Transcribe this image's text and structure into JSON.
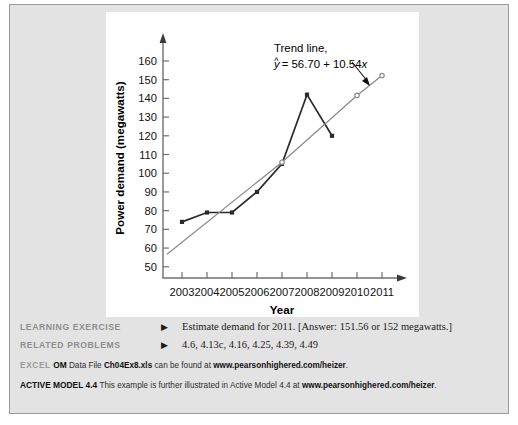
{
  "chart_data": {
    "type": "line",
    "title": "",
    "xlabel": "Year",
    "ylabel": "Power demand (megawatts)",
    "x": [
      2003,
      2004,
      2005,
      2006,
      2007,
      2008,
      2009,
      2010,
      2011
    ],
    "xlim": [
      2002.4,
      2011.6
    ],
    "ylim": [
      44,
      168
    ],
    "yticks": [
      50,
      60,
      70,
      80,
      90,
      100,
      110,
      120,
      130,
      140,
      150,
      160
    ],
    "xticks": [
      "2003",
      "2004",
      "2005",
      "2006",
      "2007",
      "2008",
      "2009",
      "2010",
      "2011"
    ],
    "grid": false,
    "legend": "none",
    "series": [
      {
        "name": "Actual power demand",
        "color": "#2b2b2b",
        "marker": "square",
        "x": [
          2003,
          2004,
          2005,
          2006,
          2007,
          2008,
          2009
        ],
        "values": [
          74,
          79,
          79,
          90,
          105,
          142,
          120
        ]
      },
      {
        "name": "Trend line",
        "color": "#8c8c8c",
        "marker": "circle",
        "x": [
          2002.4,
          2007,
          2010,
          2011
        ],
        "values": [
          56.7,
          105.9,
          141.6,
          152.2
        ]
      }
    ],
    "annotations": [
      {
        "name": "trend-line-callout",
        "line1": "Trend line,",
        "line2_prefix": "y",
        "line2_hat": "^",
        "line2_rest": " = 56.70 + 10.54",
        "line2_var": "x",
        "arrow": true
      }
    ]
  },
  "notes": {
    "learning_exercise": {
      "tag": "LEARNING EXERCISE",
      "marker": "▶",
      "body": "Estimate demand for 2011. [Answer: 151.56 or 152 megawatts.]"
    },
    "related_problems": {
      "tag": "RELATED PROBLEMS",
      "marker": "▶",
      "body": "4.6, 4.13c, 4.16, 4.25, 4.39, 4.49"
    },
    "excel_om": {
      "tag": "EXCEL",
      "bold_tag": "OM",
      "text_before": " Data File ",
      "file": "Ch04Ex8.xls",
      "text_mid": " can be found at ",
      "url": "www.pearsonhighered.com/heizer",
      "text_after": "."
    },
    "active_model": {
      "tag": "ACTIVE MODEL",
      "number": "4.4",
      "text_before": " This example is further illustrated in Active Model 4.4 at ",
      "url": "www.pearsonhighered.com/heizer",
      "text_after": "."
    }
  },
  "colors": {
    "page_background": "#e3e3e3",
    "panel_background": "#ffffff",
    "frame_border": "#9a9a9a",
    "data_line": "#2b2b2b",
    "trend_line": "#8c8c8c",
    "tag_gray": "#8e8e8e",
    "text_black": "#1a1a1a"
  }
}
